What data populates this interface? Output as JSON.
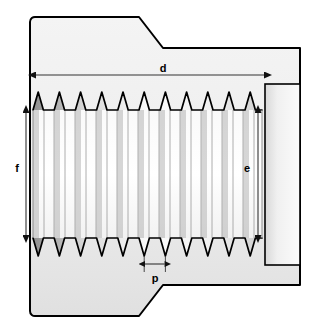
{
  "diagram": {
    "view": "sectional side view",
    "background_color": "#ffffff",
    "outline_color": "#000000",
    "body_fill_light": "#f2f2f2",
    "body_fill_mid": "#e2e2e2",
    "thread_fill_light": "#ffffff",
    "thread_fill_dark": "#9a9a9a",
    "dimension_line_color": "#333333"
  },
  "dimensions": {
    "d": {
      "label": "d",
      "name": "thread-length",
      "orientation": "horizontal",
      "arrow_style": "double",
      "label_x": 163,
      "label_y": 72
    },
    "e": {
      "label": "e",
      "name": "thread-root-diameter",
      "orientation": "vertical",
      "arrow_style": "double",
      "label_x": 247,
      "label_y": 168
    },
    "f": {
      "label": "f",
      "name": "thread-crest-diameter",
      "orientation": "vertical",
      "arrow_style": "double",
      "label_x": 20,
      "label_y": 168
    },
    "p": {
      "label": "p",
      "name": "thread-pitch",
      "orientation": "horizontal",
      "arrow_style": "double",
      "label_x": 160,
      "label_y": 275
    }
  },
  "geometry": {
    "body_left": 30,
    "body_right": 300,
    "body_top": 17,
    "body_bottom": 316,
    "thread_left": 33,
    "thread_right": 262,
    "thread_crest_top": 92,
    "thread_root_top": 110,
    "thread_root_bottom": 238,
    "thread_crest_bottom": 256,
    "thread_count": 11,
    "shoulder_step_x": 265,
    "chamfer_top_y": 48,
    "chamfer_bottom_y": 287
  }
}
